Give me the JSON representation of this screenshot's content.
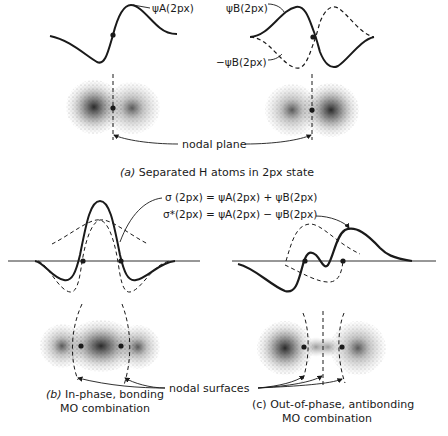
{
  "panel_a": {
    "label_psi_a": "ψA(2px)",
    "label_psi_b": "ψB(2px)",
    "label_neg_psi_b": "−ψB(2px)",
    "nodal_plane": "nodal plane",
    "caption_letter": "(a)",
    "caption_text": "Separated H atoms in 2px state"
  },
  "panel_bc": {
    "eq_sigma": "σ (2px) = ψA(2px) + ψB(2px)",
    "eq_sigma_star": "σ*(2px) = ψA(2px) − ψB(2px)",
    "nodal_surfaces": "nodal surfaces"
  },
  "panel_b": {
    "caption_letter": "(b)",
    "caption_line1": "In-phase, bonding",
    "caption_line2": "MO combination"
  },
  "panel_c": {
    "caption_letter": "(c)",
    "caption_line1": "Out-of-phase, antibonding",
    "caption_line2": "MO combination"
  },
  "colors": {
    "ink": "#1a1a1a",
    "paper": "#ffffff"
  }
}
